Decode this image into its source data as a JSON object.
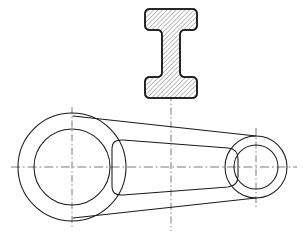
{
  "document": {
    "title": "Connecting Rod Engineering Drawing",
    "type": "mechanical-orthographic-drawing",
    "background_color": "#ffffff",
    "line_color": "#1a1a1a",
    "centerline_color": "#6b6b6b",
    "hatch_color": "#555555",
    "canvas": {
      "width": 306,
      "height": 239
    }
  },
  "views": {
    "section_view": {
      "name": "I-beam section",
      "label": "",
      "hatched": true,
      "hatch_angle_deg": 45,
      "hatch_spacing_px": 3.2,
      "bounds": {
        "x": 145,
        "y": 9,
        "width": 52,
        "height": 89
      },
      "geometry": {
        "top_flange": {
          "x": 145,
          "y": 9,
          "width": 52,
          "height": 21,
          "corner_radius": 5
        },
        "bottom_flange": {
          "x": 145,
          "y": 77,
          "width": 52,
          "height": 21,
          "corner_radius": 5
        },
        "web": {
          "x": 162,
          "y": 30,
          "width": 18,
          "height": 47,
          "fillet_radius": 5
        }
      }
    },
    "plan_view": {
      "name": "Connecting rod body",
      "label": "",
      "large_hub": {
        "center_x": 72,
        "center_y": 167,
        "outer_radius": 54,
        "inner_radius": 38
      },
      "small_hub": {
        "center_x": 256,
        "center_y": 167,
        "outer_radius": 31,
        "inner_radius": 22
      },
      "shank": {
        "top_outer": {
          "x1": 73,
          "y1": 116,
          "x2": 256,
          "y2": 136
        },
        "bottom_outer": {
          "x1": 73,
          "y1": 218,
          "x2": 256,
          "y2": 198
        },
        "top_inner": {
          "x1": 112,
          "y1": 141,
          "x2": 237,
          "y2": 150
        },
        "bottom_inner": {
          "x1": 112,
          "y1": 193,
          "x2": 237,
          "y2": 184
        },
        "web_corner_radius": 11
      }
    }
  },
  "centerlines": {
    "horizontal": {
      "y": 167,
      "x_start": 11,
      "x_end": 297
    },
    "vertical_left": {
      "x": 72,
      "y_start": 107,
      "y_end": 229
    },
    "vertical_middle": {
      "x": 171,
      "y_start": 94,
      "y_end": 231
    },
    "vertical_right": {
      "x": 256,
      "y_start": 128,
      "y_end": 208
    }
  },
  "colors": {
    "outline": "#1a1a1a",
    "centerline": "#6b6b6b",
    "hatch": "#555555",
    "background": "#ffffff"
  }
}
